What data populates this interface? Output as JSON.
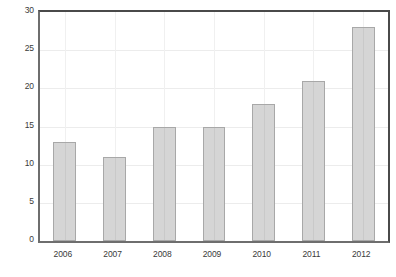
{
  "chart_data": {
    "type": "bar",
    "title": "",
    "subtitle": "",
    "xlabel": "",
    "ylabel": "",
    "categories": [
      "2006",
      "2007",
      "2008",
      "2009",
      "2010",
      "2011",
      "2012"
    ],
    "values": [
      13,
      11,
      15,
      15,
      18,
      21,
      28
    ],
    "series": [
      {
        "name": "",
        "values": [
          13,
          11,
          15,
          15,
          18,
          21,
          28
        ]
      }
    ],
    "ylim": [
      0,
      30
    ],
    "yticks": [
      0,
      5,
      10,
      15,
      20,
      25,
      30
    ],
    "ytick_labels": [
      "0",
      "5",
      "10",
      "15",
      "20",
      "25",
      "30"
    ],
    "xtick_labels": [
      "2006",
      "2007",
      "2008",
      "2009",
      "2010",
      "2011",
      "2012"
    ],
    "grid": true,
    "grid_axis": "both",
    "legend": false,
    "legend_position": "none",
    "annotations": [],
    "colors": {
      "bar_fill": "#d5d5d5",
      "bar_border": "#a8a8a8",
      "grid": "#ececec",
      "frame": "#4a4a4a",
      "tick_text": "#3a3a3a",
      "background": "#ffffff"
    }
  }
}
